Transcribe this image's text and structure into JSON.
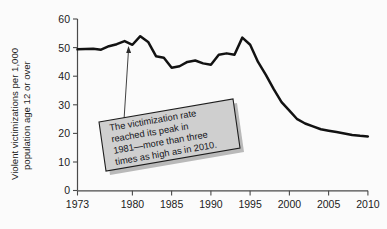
{
  "chart_data": {
    "type": "line",
    "title": "",
    "xlabel": "",
    "ylabel": "Violent victimizations per 1,000 population age 12 or over",
    "ylabel_line1": "Violent victimizations per 1,000",
    "ylabel_line2": "population age 12 or over",
    "xlim": [
      1973,
      2010
    ],
    "ylim": [
      0,
      60
    ],
    "grid": false,
    "legend": null,
    "xticks": [
      1973,
      1980,
      1985,
      1990,
      1995,
      2000,
      2005,
      2010
    ],
    "xtick_labels": [
      "1973",
      "1980",
      "1985",
      "1990",
      "1995",
      "2000",
      "2005",
      "2010"
    ],
    "yticks": [
      0,
      10,
      20,
      30,
      40,
      50,
      60
    ],
    "ytick_labels": [
      "0",
      "10",
      "20",
      "30",
      "40",
      "50",
      "60"
    ],
    "line_color": "#121212",
    "x": [
      1973,
      1974,
      1975,
      1976,
      1977,
      1978,
      1979,
      1980,
      1981,
      1982,
      1983,
      1984,
      1985,
      1986,
      1987,
      1988,
      1989,
      1990,
      1991,
      1992,
      1993,
      1994,
      1995,
      1996,
      1997,
      1998,
      1999,
      2000,
      2001,
      2002,
      2003,
      2004,
      2005,
      2006,
      2007,
      2008,
      2009,
      2010
    ],
    "values": [
      49.4,
      49.5,
      49.6,
      49.3,
      50.5,
      51.2,
      52.3,
      51.0,
      54.0,
      52.0,
      47.0,
      46.5,
      43.0,
      43.5,
      45.0,
      45.5,
      44.5,
      44.0,
      47.5,
      48.0,
      47.5,
      53.5,
      51.0,
      45.0,
      40.5,
      35.5,
      31.0,
      28.0,
      25.0,
      23.5,
      22.5,
      21.5,
      21.0,
      20.5,
      20.0,
      19.5,
      19.2,
      19.0
    ],
    "annotation": {
      "text_lines": [
        "The victimization rate",
        "reached its peak in",
        "1981—more than three",
        "times as high as in 2010."
      ],
      "full_text": "The victimization rate reached its peak in 1981—more than three times as high as in 2010.",
      "points_to_year": 1981,
      "points_to_value": 54.0,
      "box_fill": "#cfcfcf",
      "box_border": "#1d1d1d",
      "rotation_deg": -10
    }
  }
}
